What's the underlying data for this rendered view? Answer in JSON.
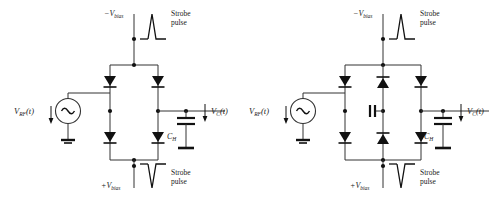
{
  "figure": {
    "background_color": "#ffffff",
    "line_color": "#1a1a1a",
    "text_color": "#1a1a1a"
  },
  "circuits": [
    {
      "id": "left-circuit",
      "name": "four-diode-sampling-bridge",
      "diode_count": 4,
      "has_center_capacitor": false,
      "labels": {
        "source": "V",
        "source_sub": "RF",
        "source_arg": "(t)",
        "top_bias": "−V",
        "top_bias_sub": "bias",
        "bottom_bias": "+V",
        "bottom_bias_sub": "bias",
        "top_strobe_line1": "Strobe",
        "top_strobe_line2": "pulse",
        "bottom_strobe_line1": "Strobe",
        "bottom_strobe_line2": "pulse",
        "hold_cap": "C",
        "hold_cap_sub": "H",
        "output": "V",
        "output_sub": "C",
        "output_arg": "(t)"
      }
    },
    {
      "id": "right-circuit",
      "name": "six-diode-sampling-bridge-with-center-capacitor",
      "diode_count": 6,
      "has_center_capacitor": true,
      "labels": {
        "source": "V",
        "source_sub": "RF",
        "source_arg": "(t)",
        "top_bias": "−V",
        "top_bias_sub": "bias",
        "bottom_bias": "+V",
        "bottom_bias_sub": "bias",
        "top_strobe_line1": "Strobe",
        "top_strobe_line2": "pulse",
        "bottom_strobe_line1": "Strobe",
        "bottom_strobe_line2": "pulse",
        "hold_cap": "C",
        "hold_cap_sub": "H",
        "output": "V",
        "output_sub": "C",
        "output_arg": "(t)"
      }
    }
  ]
}
